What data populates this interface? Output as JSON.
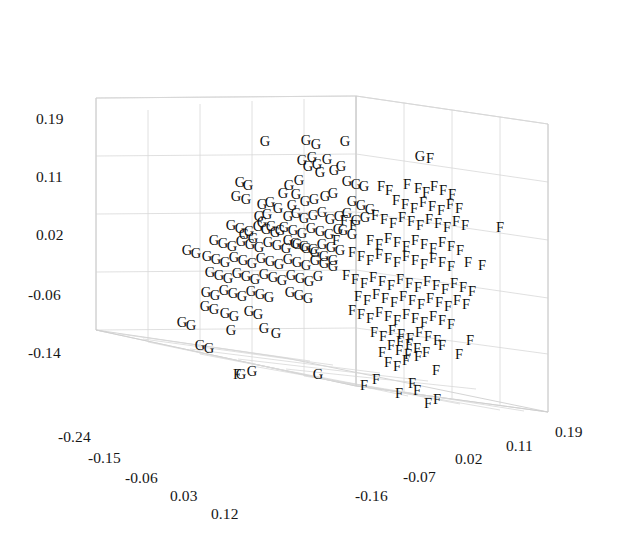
{
  "chart_data": {
    "type": "scatter",
    "title": "",
    "subtitle": "",
    "projection": "3d",
    "xlabel": "",
    "ylabel": "",
    "zlabel": "",
    "grid": true,
    "legend_position": "none",
    "annotations": [],
    "axes": {
      "z_vertical": {
        "position": "left",
        "tick_labels": [
          "0.19",
          "0.11",
          "0.02",
          "-0.06",
          "-0.14"
        ],
        "tick_values": [
          0.19,
          0.11,
          0.02,
          -0.06,
          -0.14
        ],
        "range": [
          -0.14,
          0.19
        ]
      },
      "x_depth_left": {
        "position": "bottom-left",
        "tick_labels": [
          "-0.24",
          "-0.15",
          "-0.06",
          "0.03",
          "0.12"
        ],
        "tick_values": [
          -0.24,
          -0.15,
          -0.06,
          0.03,
          0.12
        ],
        "range": [
          -0.24,
          0.12
        ]
      },
      "y_depth_right": {
        "position": "bottom-right",
        "tick_labels": [
          "-0.16",
          "-0.07",
          "0.02",
          "0.11",
          "0.19"
        ],
        "tick_values": [
          -0.16,
          -0.07,
          0.02,
          0.11,
          0.19
        ],
        "range": [
          -0.16,
          0.19
        ]
      }
    },
    "series": [
      {
        "name": "G",
        "marker": "G",
        "color": "#0d0d0d",
        "count": 118,
        "points_px": [
          [
            265,
            141
          ],
          [
            306,
            140
          ],
          [
            316,
            144
          ],
          [
            345,
            141
          ],
          [
            420,
            156
          ],
          [
            289,
            185
          ],
          [
            299,
            180
          ],
          [
            283,
            193
          ],
          [
            296,
            194
          ],
          [
            308,
            166
          ],
          [
            317,
            164
          ],
          [
            302,
            160
          ],
          [
            312,
            157
          ],
          [
            327,
            159
          ],
          [
            320,
            172
          ],
          [
            334,
            170
          ],
          [
            341,
            166
          ],
          [
            292,
            205
          ],
          [
            305,
            201
          ],
          [
            314,
            199
          ],
          [
            325,
            196
          ],
          [
            333,
            193
          ],
          [
            347,
            181
          ],
          [
            356,
            184
          ],
          [
            364,
            186
          ],
          [
            240,
            182
          ],
          [
            248,
            185
          ],
          [
            236,
            196
          ],
          [
            246,
            199
          ],
          [
            262,
            204
          ],
          [
            270,
            202
          ],
          [
            278,
            208
          ],
          [
            259,
            216
          ],
          [
            267,
            214
          ],
          [
            288,
            216
          ],
          [
            296,
            213
          ],
          [
            304,
            218
          ],
          [
            313,
            215
          ],
          [
            322,
            212
          ],
          [
            330,
            219
          ],
          [
            339,
            216
          ],
          [
            347,
            213
          ],
          [
            356,
            220
          ],
          [
            365,
            217
          ],
          [
            231,
            225
          ],
          [
            240,
            228
          ],
          [
            249,
            231
          ],
          [
            258,
            226
          ],
          [
            266,
            229
          ],
          [
            275,
            232
          ],
          [
            284,
            227
          ],
          [
            293,
            230
          ],
          [
            302,
            233
          ],
          [
            311,
            228
          ],
          [
            320,
            231
          ],
          [
            329,
            234
          ],
          [
            338,
            229
          ],
          [
            214,
            240
          ],
          [
            223,
            243
          ],
          [
            232,
            246
          ],
          [
            241,
            241
          ],
          [
            250,
            244
          ],
          [
            259,
            247
          ],
          [
            268,
            242
          ],
          [
            277,
            245
          ],
          [
            286,
            248
          ],
          [
            295,
            243
          ],
          [
            304,
            246
          ],
          [
            313,
            249
          ],
          [
            322,
            244
          ],
          [
            331,
            247
          ],
          [
            340,
            250
          ],
          [
            207,
            256
          ],
          [
            216,
            259
          ],
          [
            225,
            262
          ],
          [
            234,
            257
          ],
          [
            243,
            260
          ],
          [
            252,
            263
          ],
          [
            261,
            258
          ],
          [
            270,
            261
          ],
          [
            279,
            264
          ],
          [
            288,
            259
          ],
          [
            297,
            262
          ],
          [
            306,
            265
          ],
          [
            315,
            260
          ],
          [
            324,
            263
          ],
          [
            333,
            266
          ],
          [
            210,
            272
          ],
          [
            219,
            275
          ],
          [
            228,
            278
          ],
          [
            237,
            273
          ],
          [
            246,
            276
          ],
          [
            255,
            279
          ],
          [
            264,
            274
          ],
          [
            273,
            277
          ],
          [
            282,
            280
          ],
          [
            291,
            275
          ],
          [
            300,
            278
          ],
          [
            309,
            281
          ],
          [
            318,
            276
          ],
          [
            206,
            292
          ],
          [
            215,
            295
          ],
          [
            224,
            290
          ],
          [
            233,
            293
          ],
          [
            242,
            296
          ],
          [
            251,
            291
          ],
          [
            260,
            294
          ],
          [
            269,
            297
          ],
          [
            290,
            292
          ],
          [
            299,
            295
          ],
          [
            308,
            298
          ],
          [
            225,
            313
          ],
          [
            234,
            316
          ],
          [
            249,
            311
          ],
          [
            258,
            314
          ],
          [
            187,
            250
          ],
          [
            196,
            253
          ],
          [
            205,
            306
          ],
          [
            214,
            309
          ],
          [
            231,
            330
          ],
          [
            241,
            374
          ],
          [
            252,
            371
          ],
          [
            264,
            328
          ],
          [
            276,
            333
          ],
          [
            318,
            374
          ],
          [
            182,
            322
          ],
          [
            191,
            325
          ],
          [
            200,
            345
          ],
          [
            209,
            348
          ],
          [
            352,
            201
          ],
          [
            361,
            205
          ],
          [
            370,
            209
          ],
          [
            343,
            230
          ],
          [
            352,
            234
          ],
          [
            288,
            240
          ],
          [
            297,
            244
          ],
          [
            306,
            248
          ],
          [
            315,
            252
          ],
          [
            324,
            256
          ],
          [
            333,
            260
          ],
          [
            262,
            222
          ],
          [
            271,
            226
          ],
          [
            280,
            230
          ],
          [
            253,
            238
          ],
          [
            244,
            234
          ]
        ]
      },
      {
        "name": "F",
        "marker": "F",
        "color": "#0d0d0d",
        "count": 122,
        "points_px": [
          [
            430,
            158
          ],
          [
            381,
            186
          ],
          [
            389,
            190
          ],
          [
            407,
            184
          ],
          [
            418,
            188
          ],
          [
            426,
            192
          ],
          [
            434,
            186
          ],
          [
            443,
            190
          ],
          [
            452,
            194
          ],
          [
            396,
            200
          ],
          [
            405,
            204
          ],
          [
            414,
            208
          ],
          [
            423,
            202
          ],
          [
            432,
            206
          ],
          [
            441,
            210
          ],
          [
            450,
            204
          ],
          [
            459,
            208
          ],
          [
            375,
            215
          ],
          [
            384,
            219
          ],
          [
            393,
            223
          ],
          [
            402,
            217
          ],
          [
            411,
            221
          ],
          [
            420,
            225
          ],
          [
            429,
            219
          ],
          [
            438,
            223
          ],
          [
            447,
            227
          ],
          [
            456,
            221
          ],
          [
            465,
            225
          ],
          [
            500,
            227
          ],
          [
            370,
            240
          ],
          [
            379,
            244
          ],
          [
            388,
            238
          ],
          [
            397,
            242
          ],
          [
            406,
            246
          ],
          [
            415,
            240
          ],
          [
            424,
            244
          ],
          [
            433,
            248
          ],
          [
            442,
            242
          ],
          [
            451,
            246
          ],
          [
            460,
            250
          ],
          [
            352,
            252
          ],
          [
            361,
            256
          ],
          [
            370,
            260
          ],
          [
            379,
            254
          ],
          [
            388,
            258
          ],
          [
            397,
            262
          ],
          [
            406,
            256
          ],
          [
            415,
            260
          ],
          [
            424,
            264
          ],
          [
            433,
            258
          ],
          [
            442,
            262
          ],
          [
            451,
            266
          ],
          [
            468,
            262
          ],
          [
            482,
            265
          ],
          [
            346,
            275
          ],
          [
            355,
            279
          ],
          [
            364,
            283
          ],
          [
            373,
            277
          ],
          [
            382,
            281
          ],
          [
            391,
            285
          ],
          [
            400,
            279
          ],
          [
            409,
            283
          ],
          [
            418,
            287
          ],
          [
            427,
            281
          ],
          [
            436,
            285
          ],
          [
            445,
            289
          ],
          [
            454,
            283
          ],
          [
            463,
            287
          ],
          [
            472,
            291
          ],
          [
            358,
            296
          ],
          [
            367,
            300
          ],
          [
            376,
            294
          ],
          [
            385,
            298
          ],
          [
            394,
            302
          ],
          [
            403,
            296
          ],
          [
            412,
            300
          ],
          [
            421,
            304
          ],
          [
            430,
            298
          ],
          [
            439,
            302
          ],
          [
            448,
            306
          ],
          [
            457,
            300
          ],
          [
            466,
            304
          ],
          [
            352,
            310
          ],
          [
            361,
            314
          ],
          [
            370,
            318
          ],
          [
            379,
            312
          ],
          [
            388,
            316
          ],
          [
            397,
            320
          ],
          [
            406,
            314
          ],
          [
            415,
            318
          ],
          [
            424,
            322
          ],
          [
            433,
            316
          ],
          [
            442,
            320
          ],
          [
            451,
            324
          ],
          [
            374,
            332
          ],
          [
            383,
            336
          ],
          [
            392,
            330
          ],
          [
            401,
            334
          ],
          [
            410,
            338
          ],
          [
            419,
            332
          ],
          [
            428,
            336
          ],
          [
            437,
            340
          ],
          [
            399,
            350
          ],
          [
            408,
            354
          ],
          [
            417,
            348
          ],
          [
            426,
            352
          ],
          [
            442,
            345
          ],
          [
            459,
            354
          ],
          [
            388,
            362
          ],
          [
            397,
            366
          ],
          [
            406,
            360
          ],
          [
            418,
            356
          ],
          [
            436,
            370
          ],
          [
            376,
            379
          ],
          [
            412,
            383
          ],
          [
            399,
            393
          ],
          [
            417,
            390
          ],
          [
            428,
            403
          ],
          [
            437,
            399
          ],
          [
            364,
            385
          ],
          [
            237,
            374
          ],
          [
            391,
            345
          ],
          [
            400,
            341
          ],
          [
            409,
            344
          ],
          [
            382,
            352
          ],
          [
            470,
            340
          ],
          [
            353,
            225
          ],
          [
            344,
            220
          ],
          [
            336,
            240
          ]
        ]
      }
    ]
  },
  "ticks": {
    "z": [
      {
        "label": "0.19",
        "x": 36,
        "y": 110
      },
      {
        "label": "0.11",
        "x": 36,
        "y": 168
      },
      {
        "label": "0.02",
        "x": 36,
        "y": 226
      },
      {
        "label": "-0.06",
        "x": 28,
        "y": 286
      },
      {
        "label": "-0.14",
        "x": 28,
        "y": 344
      }
    ],
    "x_left": [
      {
        "label": "-0.24",
        "x": 58,
        "y": 428
      },
      {
        "label": "-0.15",
        "x": 88,
        "y": 449
      },
      {
        "label": "-0.06",
        "x": 125,
        "y": 469
      },
      {
        "label": "0.03",
        "x": 170,
        "y": 487
      },
      {
        "label": "0.12",
        "x": 211,
        "y": 505
      }
    ],
    "y_right": [
      {
        "label": "-0.16",
        "x": 355,
        "y": 487
      },
      {
        "label": "-0.07",
        "x": 403,
        "y": 468
      },
      {
        "label": "0.02",
        "x": 455,
        "y": 450
      },
      {
        "label": "0.11",
        "x": 506,
        "y": 437
      },
      {
        "label": "0.19",
        "x": 555,
        "y": 423
      }
    ]
  }
}
